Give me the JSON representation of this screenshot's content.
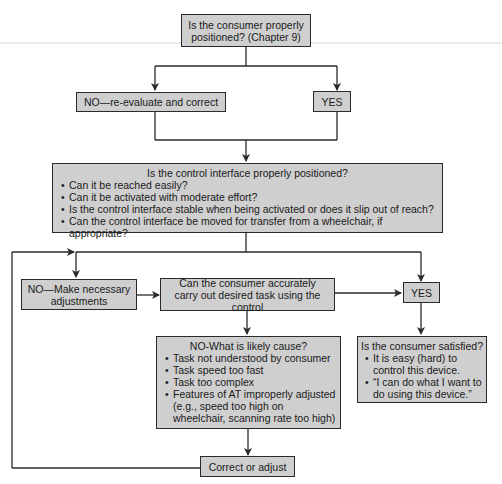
{
  "diagram": {
    "type": "flowchart",
    "nodes": {
      "q1": {
        "text": "Is the consumer properly positioned? (Chapter 9)"
      },
      "q1_no": {
        "text": "NO—re-evaluate and correct"
      },
      "q1_yes": {
        "text": "YES"
      },
      "q2": {
        "title": "Is the control interface properly positioned?",
        "items": [
          "Can it be reached easily?",
          "Can it be activated with moderate effort?",
          "Is the control interface stable when being activated or does it slip out of reach?",
          "Can the control interface be moved for transfer from a wheelchair, if appropriate?"
        ]
      },
      "adjust": {
        "text": "NO—Make necessary adjustments"
      },
      "q3": {
        "text": "Can the consumer accurately carry out desired task using the control"
      },
      "q3_yes": {
        "text": "YES"
      },
      "cause": {
        "title": "NO-What is likely cause?",
        "items": [
          "Task not understood by consumer",
          "Task speed too fast",
          "Task too complex",
          "Features of AT improperly adjusted (e.g., speed too high on wheelchair, scanning rate too high)"
        ]
      },
      "satisfied": {
        "title": "Is the consumer satisfied?",
        "items": [
          "It is easy (hard) to control this device.",
          "“I can do what I want to do using this device.”"
        ]
      },
      "correct": {
        "text": "Correct or adjust"
      }
    },
    "edges": [
      [
        "q1",
        "q1_no"
      ],
      [
        "q1",
        "q1_yes"
      ],
      [
        "q1_no",
        "q2"
      ],
      [
        "q1_yes",
        "q2"
      ],
      [
        "q2",
        "adjust"
      ],
      [
        "q2",
        "q3_yes"
      ],
      [
        "adjust",
        "q3"
      ],
      [
        "q3",
        "q3_yes"
      ],
      [
        "q3",
        "cause"
      ],
      [
        "q3_yes",
        "satisfied"
      ],
      [
        "cause",
        "correct"
      ],
      [
        "correct",
        "adjust"
      ]
    ],
    "colors": {
      "box_fill": "#cfcfcf",
      "line": "#2a2a2a"
    }
  }
}
